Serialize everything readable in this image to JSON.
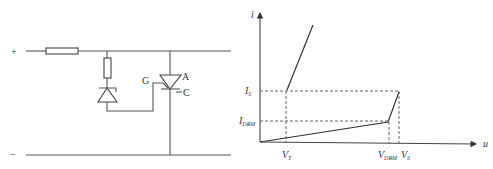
{
  "circuit": {
    "terminal_positive": "+",
    "terminal_negative": "−",
    "thyristor_labels": {
      "gate": "G",
      "anode": "A",
      "cathode": "C"
    },
    "components": [
      "fuse",
      "resistor",
      "zener-diode",
      "thyristor"
    ]
  },
  "graph": {
    "y_axis_label": "i",
    "x_axis_label": "u",
    "y_ticks": [
      {
        "main": "I",
        "sub": "S"
      },
      {
        "main": "I",
        "sub": "DRM"
      }
    ],
    "x_ticks": [
      {
        "main": "V",
        "sub": "T"
      },
      {
        "main": "V",
        "sub": "DRM"
      },
      {
        "main": "V",
        "sub": "S"
      }
    ]
  }
}
